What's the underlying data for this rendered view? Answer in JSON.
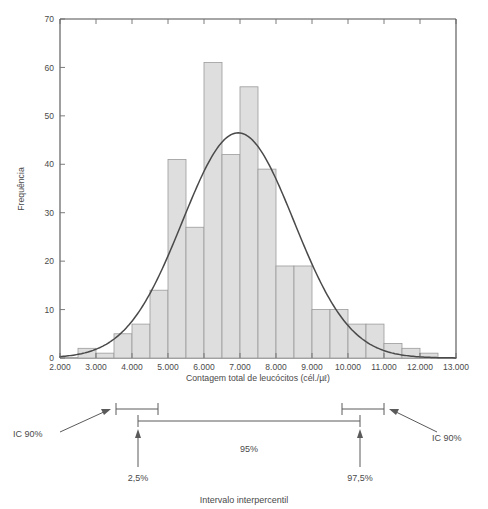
{
  "chart_data": {
    "type": "bar",
    "title": "",
    "subtitle": "",
    "xlabel": "Contagem total de leucócitos (cél./µℓ)",
    "ylabel": "Frequência",
    "xlim": [
      2000,
      13000
    ],
    "ylim": [
      0,
      70
    ],
    "grid": false,
    "legend": "none",
    "bin_width": 500,
    "x_ticks": [
      2000,
      3000,
      4000,
      5000,
      6000,
      7000,
      8000,
      9000,
      10000,
      11000,
      12000,
      13000
    ],
    "x_tick_labels": [
      "2.000",
      "3.000",
      "4.000",
      "5.000",
      "6.000",
      "7.000",
      "8.000",
      "9.000",
      "10.000",
      "11.000",
      "12.000",
      "13.000"
    ],
    "y_ticks": [
      0,
      10,
      20,
      30,
      40,
      50,
      60,
      70
    ],
    "y_tick_labels": [
      "0",
      "10",
      "20",
      "30",
      "40",
      "50",
      "60",
      "70"
    ],
    "bins": [
      {
        "start": 2500,
        "end": 3000,
        "value": 2
      },
      {
        "start": 3000,
        "end": 3500,
        "value": 1
      },
      {
        "start": 3500,
        "end": 4000,
        "value": 5
      },
      {
        "start": 4000,
        "end": 4500,
        "value": 7
      },
      {
        "start": 4500,
        "end": 5000,
        "value": 14
      },
      {
        "start": 5000,
        "end": 5500,
        "value": 41
      },
      {
        "start": 5500,
        "end": 6000,
        "value": 27
      },
      {
        "start": 6000,
        "end": 6500,
        "value": 61
      },
      {
        "start": 6500,
        "end": 7000,
        "value": 42
      },
      {
        "start": 7000,
        "end": 7500,
        "value": 56
      },
      {
        "start": 7500,
        "end": 8000,
        "value": 39
      },
      {
        "start": 8000,
        "end": 8500,
        "value": 19
      },
      {
        "start": 8500,
        "end": 9000,
        "value": 19
      },
      {
        "start": 9000,
        "end": 9500,
        "value": 10
      },
      {
        "start": 9500,
        "end": 10000,
        "value": 10
      },
      {
        "start": 10000,
        "end": 10500,
        "value": 7
      },
      {
        "start": 10500,
        "end": 11000,
        "value": 7
      },
      {
        "start": 11000,
        "end": 11500,
        "value": 3
      },
      {
        "start": 11500,
        "end": 12000,
        "value": 2
      },
      {
        "start": 12000,
        "end": 12500,
        "value": 1
      }
    ],
    "overlay_curve": {
      "type": "normal",
      "mean": 6950,
      "sd": 1550,
      "peak_value": 46.5,
      "description": "normal distribution curve fitted over histogram"
    }
  },
  "annotation": {
    "ci_left_label": "IC 90%",
    "ci_right_label": "IC 90%",
    "lower_percentile_label": "2,5%",
    "upper_percentile_label": "97,5%",
    "center_label": "95%",
    "caption": "Intervalo interpercentil"
  },
  "colors": {
    "bar_fill": "#dedede",
    "bar_stroke": "#9b9b9b",
    "curve": "#4a4a4a",
    "text": "#4a4a4a",
    "axis": "#4f4f4f",
    "background": "#ffffff"
  }
}
